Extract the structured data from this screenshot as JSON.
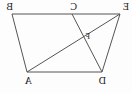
{
  "figure": {
    "type": "geometry-diagram",
    "orientation": "mirrored-horizontally",
    "background_color": "#fdfdfd",
    "stroke_color": "#555555",
    "label_color": "#1a1a1a",
    "canvas": {
      "width": 132,
      "height": 93
    },
    "points": [
      {
        "id": "E",
        "label": "E",
        "x": 12,
        "y": 14,
        "label_x": 3,
        "label_y": 2,
        "size": "normal"
      },
      {
        "id": "C",
        "label": "C",
        "x": 60,
        "y": 14,
        "label_x": 55,
        "label_y": 2,
        "size": "normal"
      },
      {
        "id": "B",
        "label": "B",
        "x": 120,
        "y": 14,
        "label_x": 119,
        "label_y": 2,
        "size": "normal"
      },
      {
        "id": "D",
        "label": "D",
        "x": 30,
        "y": 72,
        "label_x": 26,
        "label_y": 76,
        "size": "normal"
      },
      {
        "id": "A",
        "label": "A",
        "x": 105,
        "y": 72,
        "label_x": 100,
        "label_y": 76,
        "size": "normal"
      },
      {
        "id": "F",
        "label": "F",
        "x": 48,
        "y": 40,
        "label_x": 42,
        "label_y": 33,
        "size": "small"
      }
    ],
    "segments": [
      {
        "id": "EB",
        "from": "E",
        "to": "B",
        "role": "top-side"
      },
      {
        "id": "BA",
        "from": "B",
        "to": "A",
        "role": "right-side"
      },
      {
        "id": "AD",
        "from": "A",
        "to": "D",
        "role": "bottom-side"
      },
      {
        "id": "DE",
        "from": "D",
        "to": "E",
        "role": "left-side"
      },
      {
        "id": "EA",
        "from": "E",
        "to": "A",
        "role": "diagonal"
      },
      {
        "id": "CD",
        "from": "C",
        "to": "D",
        "role": "cevian"
      }
    ]
  }
}
